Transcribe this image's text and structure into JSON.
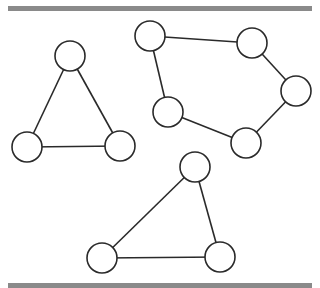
{
  "diagram": {
    "style": {
      "rule_color": "#8a8a8a",
      "stroke_color": "#2a2a2a",
      "node_fill": "#ffffff",
      "node_radius": 15
    },
    "components": [
      {
        "name": "left-triangle",
        "nodes": [
          [
            70,
            56
          ],
          [
            27,
            147
          ],
          [
            120,
            146
          ]
        ],
        "edges": [
          [
            0,
            1
          ],
          [
            0,
            2
          ],
          [
            1,
            2
          ]
        ]
      },
      {
        "name": "pentagon",
        "nodes": [
          [
            150,
            36
          ],
          [
            252,
            43
          ],
          [
            296,
            91
          ],
          [
            246,
            143
          ],
          [
            168,
            112
          ]
        ],
        "edges": [
          [
            0,
            1
          ],
          [
            1,
            2
          ],
          [
            2,
            3
          ],
          [
            3,
            4
          ],
          [
            4,
            0
          ]
        ]
      },
      {
        "name": "bottom-triangle",
        "nodes": [
          [
            195,
            167
          ],
          [
            102,
            258
          ],
          [
            220,
            257
          ]
        ],
        "edges": [
          [
            0,
            1
          ],
          [
            0,
            2
          ],
          [
            1,
            2
          ]
        ]
      }
    ]
  }
}
